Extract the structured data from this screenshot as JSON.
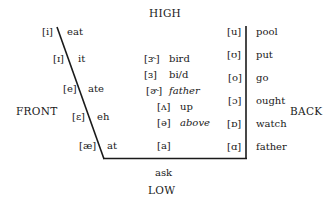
{
  "axes": {
    "high": "HIGH",
    "low": "LOW",
    "front": "FRONT",
    "back": "BACK"
  },
  "front_vowels": [
    {
      "symbol": "[i]",
      "word": "eat"
    },
    {
      "symbol": "[ɪ]",
      "word": "it"
    },
    {
      "symbol": "[e]",
      "word": "ate"
    },
    {
      "symbol": "[ɛ]",
      "word": "eh"
    },
    {
      "symbol": "[æ]",
      "word": "at"
    }
  ],
  "central_vowels": [
    {
      "symbol": "[ɝ]",
      "word": "bird"
    },
    {
      "symbol": "[ɜ]",
      "word": "bi/d"
    },
    {
      "symbol": "[ɚ]",
      "word": "father"
    },
    {
      "symbol": "[ʌ]",
      "word": "up"
    },
    {
      "symbol": "[ə]",
      "word": "above"
    },
    {
      "symbol": "[a]",
      "word": "ask"
    }
  ],
  "back_vowels": [
    {
      "symbol": "[u]",
      "word": "pool"
    },
    {
      "symbol": "[ʊ]",
      "word": "put"
    },
    {
      "symbol": "[o]",
      "word": "go"
    },
    {
      "symbol": "[ɔ]",
      "word": "ought"
    },
    {
      "symbol": "[ɒ]",
      "word": "watch"
    },
    {
      "symbol": "[ɑ]",
      "word": "father"
    }
  ]
}
